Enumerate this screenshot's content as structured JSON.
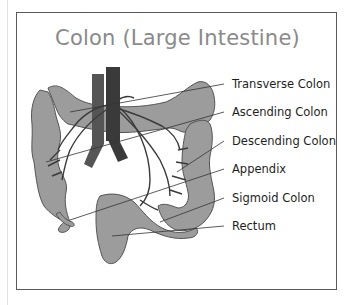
{
  "title": "Colon (Large Intestine)",
  "colors": {
    "organ_fill": "#9c9c9c",
    "organ_stroke": "#555555",
    "vessel_dark": "#3a3a3a",
    "vessel_mid": "#555555",
    "title_text": "#8a8a8a",
    "label_text": "#1e1e1e",
    "frame": "#5a5a5a"
  },
  "labels": [
    {
      "text": "Transverse Colon",
      "y": 84,
      "target": [
        70,
        112
      ]
    },
    {
      "text": "Ascending Colon",
      "y": 112,
      "target": [
        46,
        162
      ]
    },
    {
      "text": "Descending Colon",
      "y": 141,
      "target": [
        177,
        172
      ]
    },
    {
      "text": "Appendix",
      "y": 169,
      "target": [
        70,
        220
      ]
    },
    {
      "text": "Sigmoid Colon",
      "y": 198,
      "target": [
        160,
        222
      ]
    },
    {
      "text": "Rectum",
      "y": 226,
      "target": [
        112,
        236
      ]
    }
  ]
}
